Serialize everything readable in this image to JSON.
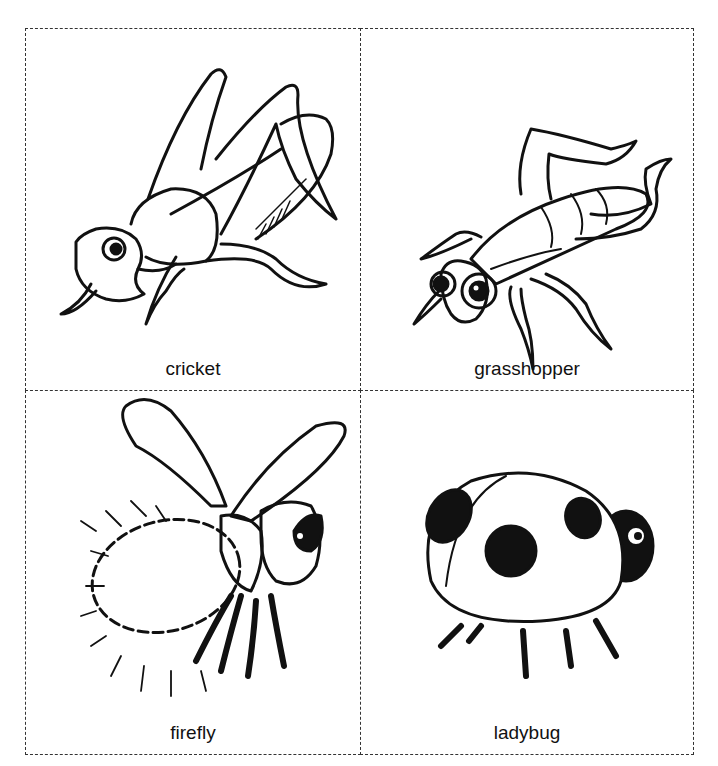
{
  "sheet": {
    "title": "Insect flashcards",
    "cards": [
      {
        "label": "cricket",
        "illustration": "cricket-illustration"
      },
      {
        "label": "grasshopper",
        "illustration": "grasshopper-illustration"
      },
      {
        "label": "firefly",
        "illustration": "firefly-illustration"
      },
      {
        "label": "ladybug",
        "illustration": "ladybug-illustration"
      }
    ]
  },
  "colors": {
    "ink": "#111111",
    "border": "#333333",
    "paper": "#ffffff"
  }
}
